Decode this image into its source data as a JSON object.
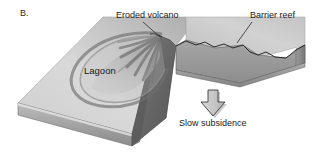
{
  "figure": {
    "panel_letter": "B.",
    "background_color": "#ffffff",
    "width": 327,
    "height": 161
  },
  "labels": {
    "eroded_volcano": "Eroded volcano",
    "barrier_reef": "Barrier reef",
    "lagoon": "Lagoon",
    "slow_subsidence": "Slow subsidence"
  },
  "icons": {
    "down_arrow": "down-arrow-icon",
    "leader_line_volcano": "leader-line-icon",
    "leader_line_reef": "leader-line-icon"
  },
  "colors": {
    "text": "#1a1a1a",
    "background": "#ffffff",
    "block_top_light": "#d8d8d8",
    "block_top_dark": "#a8a8a8",
    "block_front_light": "#b4b4b4",
    "block_front_dark": "#8e8e8e",
    "cut_face_dark": "#6d6d6d",
    "cross_section": "#9a9a9a",
    "reef_outline": "#707070",
    "volcano_ridge": "#5e5e5e",
    "arrow_fill": "#c9c9c9",
    "arrow_outline": "#3a3a3a",
    "arrow_shadow": "#9b9b9b",
    "outline": "#2e2e2e"
  },
  "geometry": {
    "left_block_top_surface": "parallelogram from upper-centre to lower-left",
    "right_block": "cut-away wedge at right revealing cross-section",
    "subsidence_arrow": {
      "x": 203,
      "y": 90,
      "width": 22,
      "height": 27,
      "direction": "down"
    }
  }
}
